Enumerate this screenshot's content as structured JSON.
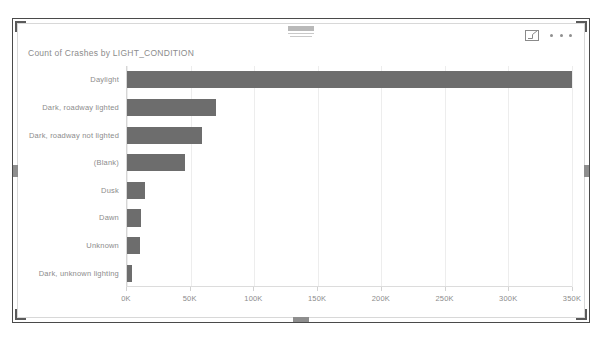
{
  "visual": {
    "title": "Count of Crashes by LIGHT_CONDITION",
    "header": {
      "focus_mode_label": "focus-mode",
      "more_options_label": "More options"
    }
  },
  "chart_data": {
    "type": "bar",
    "orientation": "horizontal",
    "title": "Count of Crashes by LIGHT_CONDITION",
    "xlabel": "",
    "ylabel": "",
    "xlim": [
      0,
      350000
    ],
    "grid": true,
    "legend": "none",
    "categories": [
      "Daylight",
      "Dark, roadway lighted",
      "Dark, roadway not lighted",
      "(Blank)",
      "Dusk",
      "Dawn",
      "Unknown",
      "Dark, unknown lighting"
    ],
    "values": [
      360000,
      70000,
      59000,
      46000,
      14000,
      11000,
      10000,
      4000
    ],
    "tick_labels": [
      "0K",
      "50K",
      "100K",
      "150K",
      "200K",
      "250K",
      "300K",
      "350K"
    ],
    "tick_values": [
      0,
      50000,
      100000,
      150000,
      200000,
      250000,
      300000,
      350000
    ],
    "bar_color": "#6d6d6d",
    "gridline_color": "#ededed",
    "text_color": "#8c8c8c"
  }
}
